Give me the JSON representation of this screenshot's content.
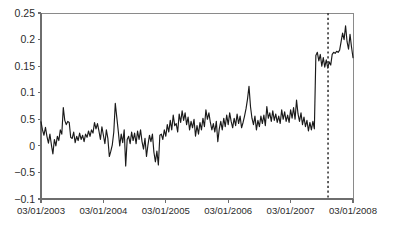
{
  "chart_data": {
    "type": "line",
    "title": "",
    "subtitle": "",
    "xlabel": "",
    "ylabel": "",
    "grid": false,
    "legend": null,
    "legend_position": "none",
    "xlim": [
      "03/01/2003",
      "03/01/2008"
    ],
    "ylim": [
      -0.1,
      0.25
    ],
    "y_tick_labels": [
      "0.25",
      "0.2",
      "0.15",
      "0.1",
      "0.5",
      "0",
      "-0.5",
      "-0.1"
    ],
    "y_tick_values": [
      0.25,
      0.2,
      0.15,
      0.1,
      0.05,
      0,
      -0.05,
      -0.1
    ],
    "x_tick_labels": [
      "03/01/2003",
      "03/01/2004",
      "03/01/2005",
      "03/01/2006",
      "03/01/2007",
      "03/01/2008"
    ],
    "x_tick_positions": [
      0,
      1,
      2,
      3,
      4,
      5
    ],
    "series": [
      {
        "name": "series-1",
        "color": "#1a1a1a",
        "values": [
          0.045,
          0.03,
          0.02,
          0.035,
          0.018,
          0.005,
          0.022,
          0.002,
          -0.015,
          0.012,
          0.0,
          0.018,
          0.01,
          0.03,
          0.022,
          0.072,
          0.048,
          0.04,
          0.046,
          0.044,
          0.016,
          0.014,
          0.026,
          0.006,
          0.018,
          0.01,
          0.024,
          0.012,
          0.02,
          0.008,
          0.022,
          0.016,
          0.028,
          0.018,
          0.03,
          0.024,
          0.044,
          0.032,
          0.042,
          0.028,
          0.012,
          0.036,
          0.02,
          0.004,
          0.03,
          0.014,
          -0.02,
          -0.01,
          0.002,
          0.026,
          0.08,
          0.054,
          0.028,
          0.0,
          0.022,
          0.006,
          0.03,
          -0.038,
          0.012,
          0.018,
          0.004,
          0.026,
          0.01,
          0.024,
          0.004,
          0.028,
          0.012,
          0.03,
          0.008,
          -0.006,
          0.014,
          -0.02,
          0.002,
          0.02,
          0.008,
          0.022,
          -0.012,
          -0.03,
          -0.01,
          -0.036,
          0.02,
          0.022,
          0.012,
          0.03,
          0.018,
          0.04,
          0.026,
          0.048,
          0.03,
          0.058,
          0.038,
          0.042,
          0.026,
          0.06,
          0.044,
          0.066,
          0.048,
          0.062,
          0.04,
          0.054,
          0.03,
          0.046,
          0.034,
          0.05,
          0.018,
          0.038,
          0.022,
          0.044,
          0.03,
          0.052,
          0.036,
          0.068,
          0.05,
          0.062,
          0.044,
          0.03,
          0.042,
          0.026,
          0.046,
          0.008,
          0.032,
          0.046,
          0.03,
          0.052,
          0.036,
          0.058,
          0.04,
          0.062,
          0.046,
          0.034,
          0.052,
          0.038,
          0.06,
          0.042,
          0.056,
          0.034,
          0.044,
          0.056,
          0.07,
          0.088,
          0.112,
          0.074,
          0.052,
          0.04,
          0.056,
          0.03,
          0.048,
          0.036,
          0.056,
          0.042,
          0.058,
          0.038,
          0.074,
          0.052,
          0.062,
          0.046,
          0.066,
          0.048,
          0.06,
          0.044,
          0.056,
          0.042,
          0.068,
          0.05,
          0.064,
          0.046,
          0.058,
          0.044,
          0.068,
          0.052,
          0.072,
          0.05,
          0.086,
          0.06,
          0.046,
          0.062,
          0.04,
          0.054,
          0.036,
          0.048,
          0.028,
          0.044,
          0.03,
          0.046,
          0.032,
          0.17,
          0.176,
          0.16,
          0.172,
          0.15,
          0.166,
          0.148,
          0.162,
          0.146,
          0.158,
          0.152,
          0.172,
          0.176,
          0.174,
          0.178,
          0.176,
          0.18,
          0.196,
          0.212,
          0.2,
          0.226,
          0.196,
          0.182,
          0.21,
          0.186,
          0.166
        ]
      }
    ],
    "annotations": [
      {
        "name": "event-divider",
        "type": "vertical-dashed-line",
        "x_fraction": 0.92,
        "color": "#3a3a3a",
        "label": ""
      }
    ]
  }
}
